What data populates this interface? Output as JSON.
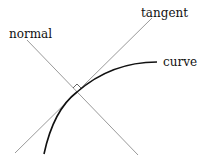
{
  "diagram": {
    "title": "",
    "labels": {
      "tangent": "tangent",
      "normal": "normal",
      "curve": "curve"
    },
    "elements": [
      {
        "name": "tangent-line",
        "from": [
          15,
          153
        ],
        "to": [
          152,
          18
        ]
      },
      {
        "name": "normal-line",
        "from": [
          27,
          40
        ],
        "to": [
          138,
          155
        ]
      },
      {
        "name": "curve",
        "start": [
          44,
          154
        ],
        "through": [
          77,
          92
        ],
        "end": [
          157,
          62
        ]
      },
      {
        "name": "right-angle-marker",
        "at": [
          77,
          92
        ]
      }
    ],
    "colors": {
      "lines": "#9a9a9a",
      "curve": "#111111",
      "text": "#111111",
      "background": "#ffffff"
    }
  }
}
